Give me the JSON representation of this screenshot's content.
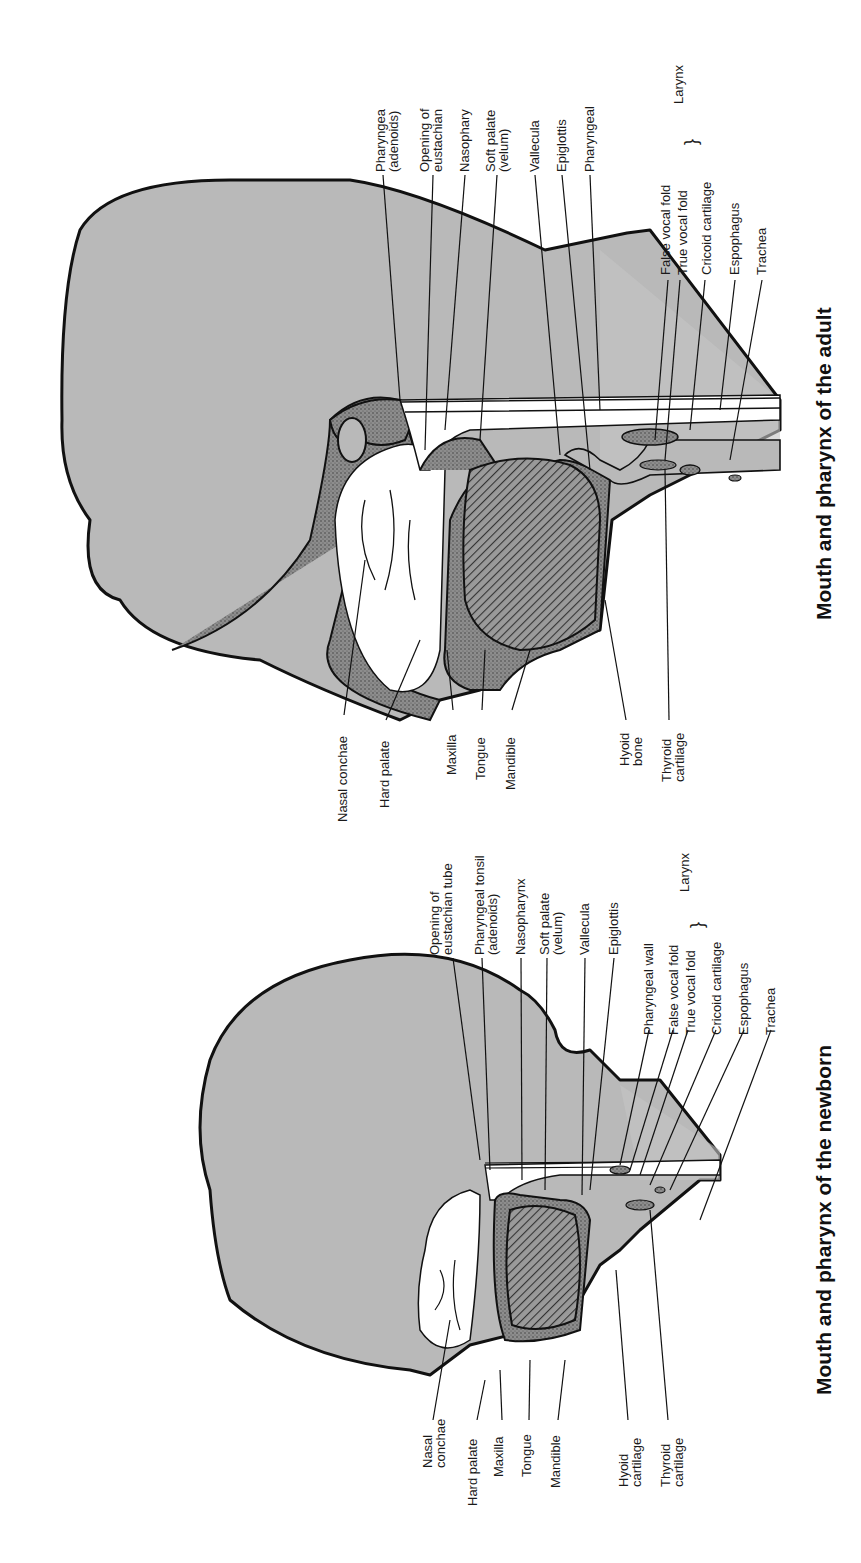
{
  "figures": [
    {
      "id": "adult",
      "title": "Mouth and pharynx of the adult",
      "labels_top": [
        {
          "line1": "Pharyngea",
          "line2": "(adenoids)"
        },
        {
          "line1": "Opening of",
          "line2": "eustachian"
        },
        {
          "line1": "Nasophary",
          "line2": ""
        },
        {
          "line1": "Soft palate",
          "line2": "(velum)"
        },
        {
          "line1": "Vallecula",
          "line2": ""
        },
        {
          "line1": "Epiglottis",
          "line2": ""
        },
        {
          "line1": "Pharyngeal",
          "line2": ""
        },
        {
          "line1": "False vocal fold",
          "line2": ""
        },
        {
          "line1": "True vocal fold",
          "line2": ""
        },
        {
          "line1": "Cricoid cartilage",
          "line2": ""
        },
        {
          "line1": "Espophagus",
          "line2": ""
        },
        {
          "line1": "Trachea",
          "line2": ""
        }
      ],
      "larynx_bracket_label": "Larynx",
      "labels_bottom": [
        {
          "line1": "Nasal conchae",
          "line2": ""
        },
        {
          "line1": "Hard palate",
          "line2": ""
        },
        {
          "line1": "Maxilla",
          "line2": ""
        },
        {
          "line1": "Tongue",
          "line2": ""
        },
        {
          "line1": "Mandible",
          "line2": ""
        },
        {
          "line1": "Hyoid",
          "line2": "bone"
        },
        {
          "line1": "Thyroid",
          "line2": "cartilage"
        }
      ]
    },
    {
      "id": "newborn",
      "title": "Mouth and pharynx of the newborn",
      "labels_top": [
        {
          "line1": "Opening of",
          "line2": "eustachian tube"
        },
        {
          "line1": "Pharyngeal tonsil",
          "line2": "(adenoids)"
        },
        {
          "line1": "Nasopharynx",
          "line2": ""
        },
        {
          "line1": "Soft palate",
          "line2": "(velum)"
        },
        {
          "line1": "Vallecula",
          "line2": ""
        },
        {
          "line1": "Epiglottis",
          "line2": ""
        },
        {
          "line1": "Pharyngeal wall",
          "line2": ""
        },
        {
          "line1": "False vocal fold",
          "line2": ""
        },
        {
          "line1": "True vocal fold",
          "line2": ""
        },
        {
          "line1": "Cricoid cartilage",
          "line2": ""
        },
        {
          "line1": "Espophagus",
          "line2": ""
        },
        {
          "line1": "Trachea",
          "line2": ""
        }
      ],
      "larynx_bracket_label": "Larynx",
      "labels_bottom": [
        {
          "line1": "Nasal",
          "line2": "conchae"
        },
        {
          "line1": "Hard palate",
          "line2": ""
        },
        {
          "line1": "Maxilla",
          "line2": ""
        },
        {
          "line1": "Tongue",
          "line2": ""
        },
        {
          "line1": "Mandible",
          "line2": ""
        },
        {
          "line1": "Hyoid",
          "line2": "cartilage"
        },
        {
          "line1": "Thyroid",
          "line2": "cartilage"
        }
      ]
    }
  ],
  "colors": {
    "tissue": "#b8b8b8",
    "bone": "#8a8a8a",
    "outline": "#111111",
    "cavity": "#ffffff",
    "tongue_hatch": "#555555"
  }
}
